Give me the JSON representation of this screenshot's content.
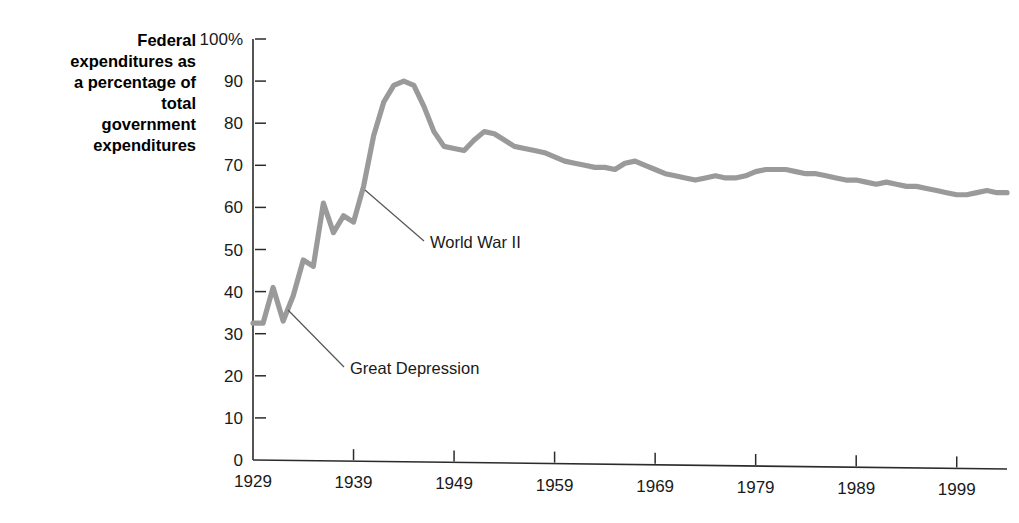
{
  "chart_data": {
    "type": "line",
    "title": "",
    "subtitle": "",
    "xlabel": "",
    "ylabel": "Federal expenditures as a percentage of total government expenditures",
    "ylabel_lines": [
      "Federal",
      "expenditures as",
      "a percentage of",
      "total",
      "government",
      "expenditures"
    ],
    "series_name": "Federal share of total government expenditures",
    "series_color": "#9a9a9a",
    "axis_color": "#2b2b2b",
    "annotation_color": "#55555a",
    "grid": false,
    "legend": "none",
    "xlim": [
      1929,
      2004
    ],
    "ylim": [
      0,
      100
    ],
    "y_ticks": [
      0,
      10,
      20,
      30,
      40,
      50,
      60,
      70,
      80,
      90,
      100
    ],
    "y_tick_labels": [
      "0",
      "10",
      "20",
      "30",
      "40",
      "50",
      "60",
      "70",
      "80",
      "90",
      "100%"
    ],
    "x_ticks": [
      1929,
      1939,
      1949,
      1959,
      1969,
      1979,
      1989,
      1999
    ],
    "x_tick_labels": [
      "1929",
      "1939",
      "1949",
      "1959",
      "1969",
      "1979",
      "1989",
      "1999"
    ],
    "x": [
      1929,
      1930,
      1931,
      1932,
      1933,
      1934,
      1935,
      1936,
      1937,
      1938,
      1939,
      1940,
      1941,
      1942,
      1943,
      1944,
      1945,
      1946,
      1947,
      1948,
      1949,
      1950,
      1951,
      1952,
      1953,
      1954,
      1955,
      1956,
      1957,
      1958,
      1959,
      1960,
      1961,
      1962,
      1963,
      1964,
      1965,
      1966,
      1967,
      1968,
      1969,
      1970,
      1971,
      1972,
      1973,
      1974,
      1975,
      1976,
      1977,
      1978,
      1979,
      1980,
      1981,
      1982,
      1983,
      1984,
      1985,
      1986,
      1987,
      1988,
      1989,
      1990,
      1991,
      1992,
      1993,
      1994,
      1995,
      1996,
      1997,
      1998,
      1999,
      2000,
      2001,
      2002,
      2003,
      2004
    ],
    "values": [
      32.5,
      32.5,
      41.0,
      33.0,
      39.0,
      47.5,
      46.0,
      61.0,
      54.0,
      58.0,
      56.5,
      65.0,
      77.0,
      85.0,
      89.0,
      90.0,
      89.0,
      84.0,
      78.0,
      74.5,
      74.0,
      73.5,
      76.0,
      78.0,
      77.5,
      76.0,
      74.5,
      74.0,
      73.5,
      73.0,
      72.0,
      71.0,
      70.5,
      70.0,
      69.5,
      69.5,
      69.0,
      70.5,
      71.0,
      70.0,
      69.0,
      68.0,
      67.5,
      67.0,
      66.5,
      67.0,
      67.5,
      67.0,
      67.0,
      67.5,
      68.5,
      69.0,
      69.0,
      69.0,
      68.5,
      68.0,
      68.0,
      67.5,
      67.0,
      66.5,
      66.5,
      66.0,
      65.5,
      66.0,
      65.5,
      65.0,
      65.0,
      64.5,
      64.0,
      63.5,
      63.0,
      63.0,
      63.5,
      64.0,
      63.5,
      63.5
    ],
    "annotations": [
      {
        "label": "World War II",
        "anchor_year": 1943,
        "anchor_value": 65.0,
        "text_x": 430,
        "text_y": 248,
        "leader_from_x": 365,
        "leader_from_y": 190,
        "leader_to_x": 424,
        "leader_to_y": 241
      },
      {
        "label": "Great Depression",
        "anchor_year": 1932,
        "anchor_value": 41.0,
        "text_x": 350,
        "text_y": 374,
        "leader_from_x": 288,
        "leader_from_y": 310,
        "leader_to_x": 344,
        "leader_to_y": 367
      }
    ]
  }
}
